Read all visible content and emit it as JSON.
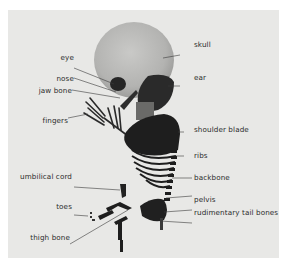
{
  "figure": {
    "background_color": "#e8e8e6",
    "bone_color": "#1c1c1c",
    "leader_line_color": "#3a3a3a",
    "labels_left": [
      {
        "id": "eye",
        "text": "eye"
      },
      {
        "id": "nose",
        "text": "nose"
      },
      {
        "id": "jaw-bone",
        "text": "jaw bone"
      },
      {
        "id": "fingers",
        "text": "fingers"
      },
      {
        "id": "umbilical-cord",
        "text": "umbilical cord"
      },
      {
        "id": "toes",
        "text": "toes"
      },
      {
        "id": "thigh-bone",
        "text": "thigh bone"
      }
    ],
    "labels_right": [
      {
        "id": "skull",
        "text": "skull"
      },
      {
        "id": "ear",
        "text": "ear"
      },
      {
        "id": "shoulder-blade",
        "text": "shoulder blade"
      },
      {
        "id": "ribs",
        "text": "ribs"
      },
      {
        "id": "backbone",
        "text": "backbone"
      },
      {
        "id": "pelvis",
        "text": "pelvis"
      },
      {
        "id": "rudimentary-tail-bones",
        "text": "rudimentary tail bones"
      }
    ]
  }
}
